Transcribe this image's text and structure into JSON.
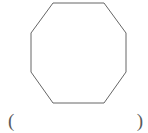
{
  "figure": {
    "shape_name": "octagon",
    "sides": 8,
    "stroke_color": "#666666",
    "fill_color": "none",
    "stroke_width": 1,
    "vertices": [
      [
        53,
        3
      ],
      [
        104,
        3
      ],
      [
        126,
        33
      ],
      [
        126,
        72
      ],
      [
        104,
        103
      ],
      [
        53,
        103
      ],
      [
        31,
        72
      ],
      [
        31,
        33
      ]
    ],
    "points_attr": "53,3 104,3 126,33 126,72 104,103 53,103 31,72 31,33"
  },
  "answer": {
    "open_paren": "(",
    "close_paren": ")",
    "value": ""
  }
}
